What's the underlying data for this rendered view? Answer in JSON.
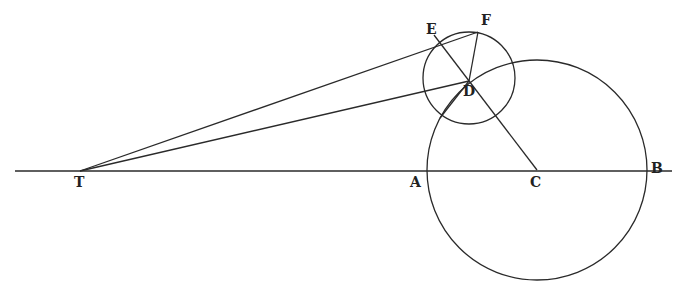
{
  "labels": {
    "T": "T",
    "A": "A",
    "C": "C",
    "B": "B",
    "D": "D",
    "E": "E",
    "F": "F"
  },
  "geometry": {
    "baseline": {
      "x1": 15,
      "x2": 672,
      "y": 171
    },
    "big_circle": {
      "cx": 537,
      "cy": 170,
      "r": 110
    },
    "small_circle": {
      "cx": 469,
      "cy": 78,
      "r": 46
    },
    "points": {
      "T": [
        80,
        171
      ],
      "D": [
        469,
        81
      ],
      "E": [
        434,
        35
      ],
      "F": [
        478,
        32
      ],
      "C": [
        537,
        170
      ]
    }
  },
  "colors": {
    "stroke": "#2a2a2a",
    "background": "#ffffff"
  }
}
